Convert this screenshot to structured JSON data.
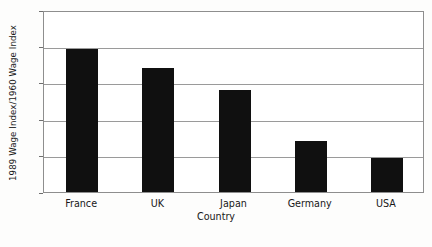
{
  "chart_data": {
    "type": "bar",
    "title": "",
    "subtitle": "",
    "xlabel": "Country",
    "ylabel": "1989 Wage Index/1960 Wage Index",
    "categories": [
      "France",
      "UK",
      "Japan",
      "Germany",
      "USA"
    ],
    "values": [
      19.7,
      17.0,
      14.0,
      7.0,
      4.7
    ],
    "series": [
      {
        "name": "Wage index ratio",
        "values": [
          19.7,
          17.0,
          14.0,
          7.0,
          4.7
        ]
      }
    ],
    "ylim": [
      0,
      25
    ],
    "yticks": [
      0,
      5,
      10,
      15,
      20,
      25
    ],
    "ytick_labels": [
      "0",
      "5",
      "10",
      "15",
      "20",
      "25"
    ],
    "grid": true,
    "grid_axis": "y",
    "legend": false,
    "legend_position": "none",
    "bar_color": "#101010",
    "gridline_color": "#9a9a9a",
    "axis_color": "#8e8e8e",
    "background_color": "#ffffff"
  },
  "axes": {
    "y_title": "1989 Wage Index/1960 Wage Index",
    "x_title": "Country"
  }
}
